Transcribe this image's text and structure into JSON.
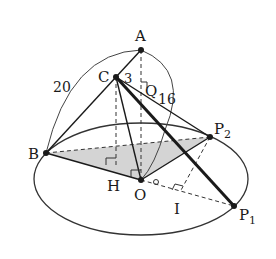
{
  "diagram": {
    "type": "3d-geometry",
    "points": {
      "A": {
        "label": "A",
        "x": 141,
        "y": 50
      },
      "C": {
        "label": "C",
        "x": 116,
        "y": 77
      },
      "B": {
        "label": "B",
        "x": 46,
        "y": 153
      },
      "O": {
        "label": "O",
        "x": 141,
        "y": 180
      },
      "H": {
        "label": "H",
        "x": 116,
        "y": 168
      },
      "Q": {
        "label": "Q",
        "x": 141,
        "y": 88
      },
      "I": {
        "label": "I",
        "x": 180,
        "y": 192
      },
      "P2": {
        "label": "P",
        "sub": "2",
        "x": 210,
        "y": 137
      },
      "P1": {
        "label": "P",
        "sub": "1",
        "x": 234,
        "y": 206
      }
    },
    "measurements": {
      "arc_AB": "20",
      "arc_AO": "16",
      "seg_CA": "3"
    },
    "colors": {
      "line": "#1a1a1a",
      "shade": "#d4d4d4",
      "background": "#ffffff"
    }
  },
  "labels": {
    "A": "A",
    "B": "B",
    "C": "C",
    "H": "H",
    "O": "O",
    "Q": "Q",
    "I": "I",
    "P": "P",
    "sub1": "1",
    "sub2": "2",
    "n20": "20",
    "n16": "16",
    "n3": "3"
  }
}
